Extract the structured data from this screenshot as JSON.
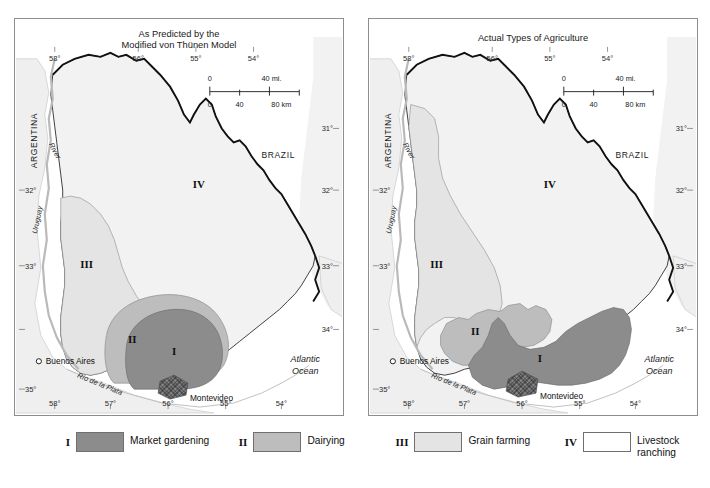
{
  "figure": {
    "kind": "two-panel thematic map comparison",
    "region": "Uruguay"
  },
  "panels": [
    {
      "id": "predicted",
      "title_line1": "As Predicted by the",
      "title_line2": "Modified von Thünen Model",
      "zone_labels": {
        "I": "I",
        "II": "II",
        "III": "III",
        "IV": "IV"
      },
      "labels": {
        "argentina": "ARGENTINA",
        "brazil": "BRAZIL",
        "river": "River",
        "uruguay_river": "Uruguay",
        "buenos_aires": "Buenos Aires",
        "montevideo": "Montevideo",
        "rio_de_la_plata": "Río de la Plata",
        "atlantic_line1": "Atlantic",
        "atlantic_line2": "Ocean"
      },
      "graticule": {
        "top": [
          "58°",
          "56°",
          "55°",
          "54°"
        ],
        "bottom": [
          "58°",
          "57°",
          "56°",
          "55°",
          "54°"
        ],
        "left": [
          "32°",
          "33°",
          "35°"
        ],
        "right": [
          "31°",
          "32°",
          "33°",
          "34°"
        ]
      },
      "scale_bar": {
        "miles_zero": "0",
        "miles_max": "40 mi.",
        "km_zero": "0",
        "km_mid": "40",
        "km_max": "80 km"
      }
    },
    {
      "id": "actual",
      "title_line1": "Actual Types of Agriculture",
      "title_line2": "",
      "zone_labels": {
        "I": "I",
        "II": "II",
        "III": "III",
        "IV": "IV"
      },
      "labels": {
        "argentina": "ARGENTINA",
        "brazil": "BRAZIL",
        "river": "River",
        "uruguay_river": "Uruguay",
        "buenos_aires": "Buenos Aires",
        "montevideo": "Montevideo",
        "rio_de_la_plata": "Río de la Plata",
        "atlantic_line1": "Atlantic",
        "atlantic_line2": "Ocean"
      },
      "graticule": {
        "top": [
          "58°",
          "56°",
          "55°",
          "54°"
        ],
        "bottom": [
          "58°",
          "57°",
          "56°",
          "55°",
          "54°"
        ],
        "left": [
          "32°",
          "33°",
          "35°"
        ],
        "right": [
          "31°",
          "32°",
          "33°",
          "34°"
        ]
      },
      "scale_bar": {
        "miles_zero": "0",
        "miles_max": "40 mi.",
        "km_zero": "0",
        "km_mid": "40",
        "km_max": "80 km"
      }
    }
  ],
  "legend": {
    "items": [
      {
        "roman": "I",
        "label": "Market gardening",
        "color": "#8c8c8c"
      },
      {
        "roman": "II",
        "label": "Dairying",
        "color": "#bdbdbd"
      },
      {
        "roman": "III",
        "label": "Grain farming",
        "color": "#e4e4e4"
      },
      {
        "roman": "IV",
        "label": "Livestock\nranching",
        "color": "#ffffff"
      }
    ]
  },
  "colors": {
    "zone1": "#8c8c8c",
    "zone2": "#bdbdbd",
    "zone3": "#e4e4e4",
    "zone4": "#f2f2f2",
    "ocean": "#ffffff",
    "land_neighbor": "#efefef",
    "border_brazil": "#111111",
    "river": "#b9b9b9",
    "frame": "#8d8d8d"
  }
}
